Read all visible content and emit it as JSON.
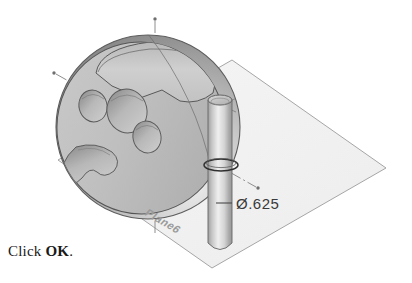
{
  "document": {
    "type": "cad-viewport-illustration",
    "background_color": "#ffffff"
  },
  "caption": {
    "prefix": "Click ",
    "emphasis": "OK",
    "suffix": "."
  },
  "viewport": {
    "name": "3d-model-view",
    "model": {
      "name": "sphere-with-cylinder-cut",
      "sphere": {
        "label": "sphere-body",
        "center_x": 148,
        "center_y": 127,
        "radius": 92,
        "fill_light": "#e8e8e8",
        "fill_mid": "#b4b4b4",
        "fill_dark": "#8d8d8d",
        "outline_color": "#5a5a5a"
      },
      "flat_face": {
        "label": "flat-circular-face",
        "fill": "#c2c2c2",
        "outline_color": "#555555"
      },
      "pockets": [
        {
          "name": "pocket-upper-left",
          "cx": 93,
          "cy": 106,
          "rx": 14,
          "ry": 16
        },
        {
          "name": "pocket-center-large",
          "cx": 127,
          "cy": 111,
          "rx": 20,
          "ry": 22
        },
        {
          "name": "pocket-lower-right",
          "cx": 147,
          "cy": 137,
          "rx": 14,
          "ry": 16
        },
        {
          "name": "pocket-lower-left-kidney",
          "cx": 96,
          "cy": 163,
          "rx": 22,
          "ry": 20
        }
      ],
      "top_recess": {
        "name": "top-curved-recess",
        "fill": "#cacaca",
        "outline_color": "#585858"
      },
      "cylinder": {
        "name": "vertical-cylinder",
        "top_y": 95,
        "bottom_y": 251,
        "left_x": 208,
        "right_x": 232,
        "fill_light": "#efefef",
        "fill_dark": "#9b9b9b",
        "outline_color": "#6a6a6a",
        "intersection_ellipse": {
          "cx": 221,
          "cy": 165,
          "rx": 17,
          "ry": 6
        }
      }
    },
    "plane": {
      "name": "reference-plane",
      "label": "Plane6",
      "fill": "#f2f2f2",
      "border_color": "#9c9c9c",
      "corners": "58,160 232,60 386,168 212,268"
    },
    "axes": [
      {
        "name": "vertical-axis-centerline",
        "style": "dash-dot",
        "color": "#8c8c8c",
        "endpoint_dot": {
          "x": 155,
          "y": 19
        }
      },
      {
        "name": "diagonal-axis-centerline",
        "style": "dash-dot",
        "color": "#8c8c8c",
        "endpoint_dot_start": {
          "x": 54,
          "y": 73
        },
        "endpoint_dot_end": {
          "x": 258,
          "y": 188
        }
      }
    ],
    "dimension": {
      "name": "diameter-callout",
      "symbol": "Ø",
      "value": ".625",
      "text": "Ø.625",
      "leader_color": "#4a4a4a",
      "text_x": 236,
      "text_y": 208
    }
  }
}
